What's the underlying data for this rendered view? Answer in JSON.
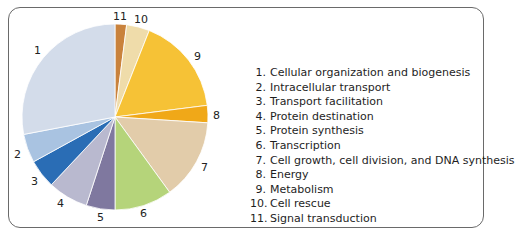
{
  "chart_data": {
    "type": "pie",
    "title": "",
    "direction": "clockwise from 12 o'clock, starting with slice 11",
    "categories": [
      "1",
      "2",
      "3",
      "4",
      "5",
      "6",
      "7",
      "8",
      "9",
      "10",
      "11"
    ],
    "labels": [
      "Cellular organization and biogenesis",
      "Intracellular transport",
      "Transport facilitation",
      "Protein destination",
      "Protein synthesis",
      "Transcription",
      "Cell growth, cell division, and DNA synthesis",
      "Energy",
      "Metabolism",
      "Cell rescue",
      "Signal transduction"
    ],
    "values": [
      28,
      5,
      5,
      7,
      5,
      10,
      14,
      3,
      17,
      4,
      2
    ],
    "colors": [
      "#d3dcea",
      "#a9c3e1",
      "#2a6db5",
      "#b9b9cf",
      "#7f789f",
      "#b5d47a",
      "#e2ccaa",
      "#f0a818",
      "#f6c236",
      "#efdcaa",
      "#c9823c"
    ],
    "legend_position": "right",
    "grid": false
  },
  "legend": {
    "items": [
      {
        "num": "1.",
        "label": "Cellular organization and biogenesis"
      },
      {
        "num": "2.",
        "label": "Intracellular transport"
      },
      {
        "num": "3.",
        "label": "Transport facilitation"
      },
      {
        "num": "4.",
        "label": "Protein destination"
      },
      {
        "num": "5.",
        "label": "Protein synthesis"
      },
      {
        "num": "6.",
        "label": "Transcription"
      },
      {
        "num": "7.",
        "label": "Cell growth, cell division, and DNA synthesis"
      },
      {
        "num": "8.",
        "label": "Energy"
      },
      {
        "num": "9.",
        "label": "Metabolism"
      },
      {
        "num": "10.",
        "label": "Cell rescue"
      },
      {
        "num": "11.",
        "label": "Signal transduction"
      }
    ]
  },
  "slice_labels": [
    "1",
    "2",
    "3",
    "4",
    "5",
    "6",
    "7",
    "8",
    "9",
    "10",
    "11"
  ]
}
